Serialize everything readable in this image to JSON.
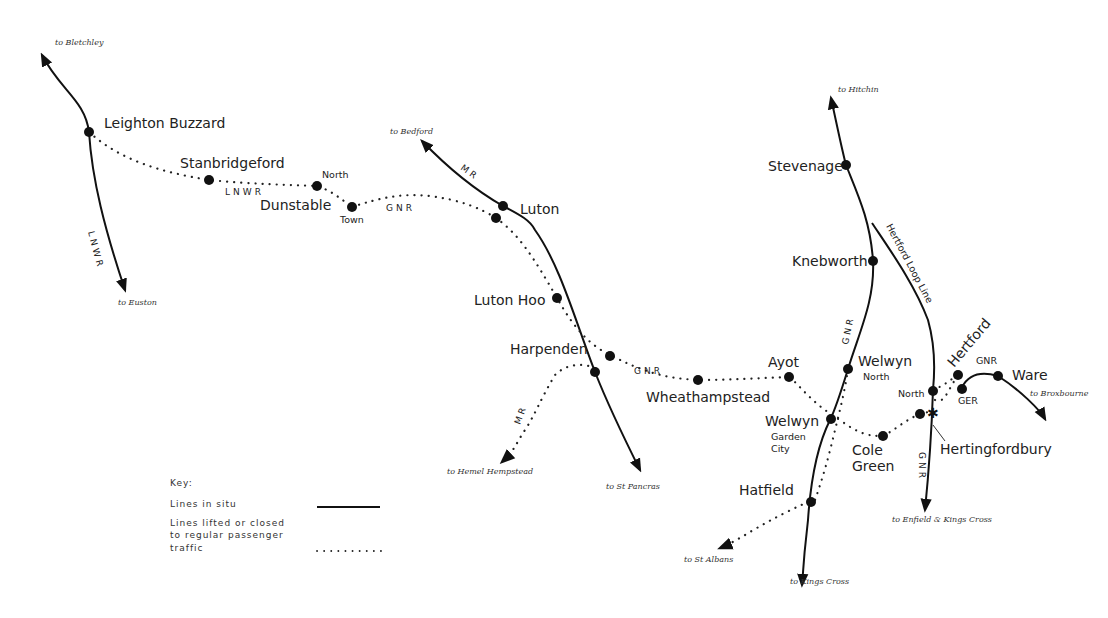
{
  "map": {
    "title": "Railway lines around Luton, Dunstable, Welwyn and Hertford",
    "colors": {
      "background": "#ffffff",
      "ink": "#111111"
    },
    "stations": [
      {
        "id": "leighton_buzzard",
        "label": "Leighton Buzzard"
      },
      {
        "id": "stanbridgeford",
        "label": "Stanbridgeford"
      },
      {
        "id": "dunstable",
        "label": "Dunstable"
      },
      {
        "id": "dunstable_north",
        "label": "North"
      },
      {
        "id": "dunstable_town",
        "label": "Town"
      },
      {
        "id": "luton",
        "label": "Luton"
      },
      {
        "id": "luton_hoo",
        "label": "Luton Hoo"
      },
      {
        "id": "harpenden",
        "label": "Harpenden"
      },
      {
        "id": "wheathampstead",
        "label": "Wheathampstead"
      },
      {
        "id": "ayot",
        "label": "Ayot"
      },
      {
        "id": "stevenage",
        "label": "Stevenage"
      },
      {
        "id": "knebworth",
        "label": "Knebworth"
      },
      {
        "id": "welwyn_north",
        "label": "Welwyn",
        "sub": "North"
      },
      {
        "id": "welwyn_gc",
        "label": "Welwyn",
        "sub1": "Garden",
        "sub2": "City"
      },
      {
        "id": "hatfield",
        "label": "Hatfield"
      },
      {
        "id": "cole_green",
        "label": "Cole",
        "sub": "Green"
      },
      {
        "id": "hertford",
        "label": "Hertford"
      },
      {
        "id": "hertford_north",
        "label": "North"
      },
      {
        "id": "hertingfordbury",
        "label": "Hertingfordbury"
      },
      {
        "id": "ware",
        "label": "Ware"
      },
      {
        "id": "ger",
        "label": "GER"
      }
    ],
    "companies": {
      "lnwr": "LNWR",
      "gnr": "GNR",
      "mr": "MR",
      "ger": "GER",
      "hertford_loop": "Hertford Loop Line"
    },
    "destinations": {
      "bletchley": "to Bletchley",
      "euston": "to Euston",
      "bedford": "to Bedford",
      "hitchin": "to Hitchin",
      "hemel": "to Hemel Hempstead",
      "st_pancras": "to St Pancras",
      "st_albans": "to St Albans",
      "kings_cross": "to Kings Cross",
      "enfield": "to Enfield & Kings Cross",
      "broxbourne": "to Broxbourne"
    },
    "key": {
      "title": "Key:",
      "solid_label": "Lines in situ",
      "dotted_label_1": "Lines lifted or closed",
      "dotted_label_2": "to regular passenger",
      "dotted_label_3": "traffic"
    }
  }
}
